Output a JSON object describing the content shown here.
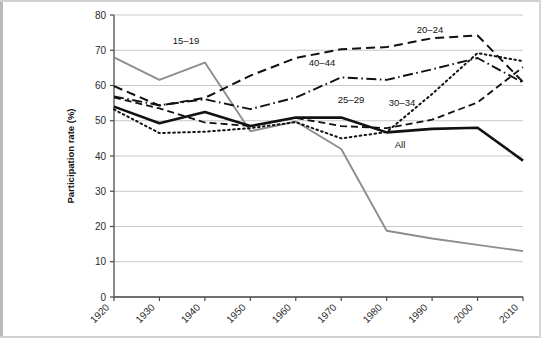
{
  "chart_data": {
    "type": "line",
    "title": "",
    "xlabel": "",
    "ylabel": "Participation rate (%)",
    "x": [
      1920,
      1930,
      1940,
      1950,
      1960,
      1970,
      1980,
      1990,
      2000,
      2010
    ],
    "xticklabels": [
      "1920",
      "1930",
      "1940",
      "1950",
      "1960",
      "1970",
      "1980",
      "1990",
      "2000",
      "2010"
    ],
    "yticklabels": [
      "0",
      "10",
      "20",
      "30",
      "40",
      "50",
      "60",
      "70",
      "80"
    ],
    "ylim": [
      0,
      80
    ],
    "ytick_step": 10,
    "grid": "horizontal",
    "legend": "inline-annotations",
    "series": [
      {
        "name": "15-19",
        "label": "15–19",
        "style": "solid",
        "color": "#8d8d8d",
        "width": 1.9,
        "values": [
          68.0,
          61.6,
          66.5,
          47.0,
          49.8,
          42.0,
          18.8,
          16.6,
          14.8,
          13.0
        ]
      },
      {
        "name": "20-24",
        "label": "20–24",
        "style": "dashed",
        "color": "#111111",
        "width": 2.0,
        "values": [
          59.8,
          54.3,
          56.5,
          62.8,
          67.8,
          70.3,
          70.9,
          73.4,
          74.2,
          61.0
        ]
      },
      {
        "name": "25-29",
        "label": "25–29",
        "style": "dotted",
        "color": "#111111",
        "width": 2.0,
        "values": [
          53.2,
          46.5,
          46.9,
          47.9,
          49.6,
          45.0,
          46.8,
          57.6,
          69.2,
          66.9
        ]
      },
      {
        "name": "30-34",
        "label": "30–34",
        "style": "dashed-thin",
        "color": "#111111",
        "width": 1.8,
        "values": [
          56.6,
          53.5,
          49.5,
          48.5,
          50.8,
          48.5,
          47.9,
          50.3,
          55.2,
          65.2
        ]
      },
      {
        "name": "40-44",
        "label": "40–44",
        "style": "dash-dot",
        "color": "#111111",
        "width": 1.9,
        "values": [
          56.9,
          54.4,
          56.1,
          53.3,
          56.6,
          62.3,
          61.6,
          64.6,
          67.8,
          60.8
        ]
      },
      {
        "name": "All",
        "label": "All",
        "style": "solid-bold",
        "color": "#111111",
        "width": 2.6,
        "values": [
          54.0,
          49.3,
          52.5,
          48.5,
          50.9,
          50.9,
          46.7,
          47.7,
          48.0,
          38.7
        ]
      }
    ],
    "annotations": [
      {
        "text": "15–19",
        "x_px": 186,
        "y_px": 44,
        "name": "series-label-15-19"
      },
      {
        "text": "20–24",
        "x_px": 430,
        "y_px": 33,
        "name": "series-label-20-24"
      },
      {
        "text": "40–44",
        "x_px": 322,
        "y_px": 66,
        "name": "series-label-40-44"
      },
      {
        "text": "25–29",
        "x_px": 351,
        "y_px": 103,
        "name": "series-label-25-29"
      },
      {
        "text": "30–34",
        "x_px": 402,
        "y_px": 106,
        "name": "series-label-30-34"
      },
      {
        "text": "All",
        "x_px": 400,
        "y_px": 148,
        "name": "series-label-all"
      }
    ]
  }
}
